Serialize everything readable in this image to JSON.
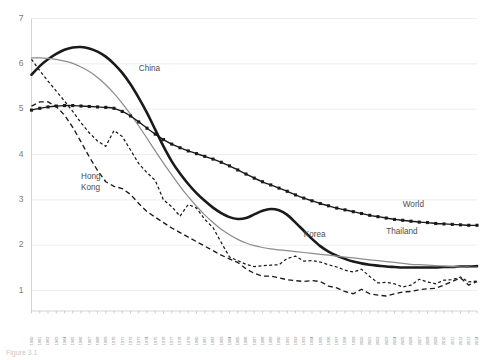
{
  "chart_data": {
    "type": "line",
    "title": "",
    "subtitle": "",
    "xlabel": "",
    "ylabel": "",
    "xlim": [
      1960,
      2014
    ],
    "ylim": [
      0.55,
      7.0
    ],
    "yticks": [
      1,
      2,
      3,
      4,
      5,
      6,
      7
    ],
    "grid": true,
    "legend_position": "inline-annotations",
    "x": [
      1960,
      1961,
      1962,
      1963,
      1964,
      1965,
      1966,
      1967,
      1968,
      1969,
      1970,
      1971,
      1972,
      1973,
      1974,
      1975,
      1976,
      1977,
      1978,
      1979,
      1980,
      1981,
      1982,
      1983,
      1984,
      1985,
      1986,
      1987,
      1988,
      1989,
      1990,
      1991,
      1992,
      1993,
      1994,
      1995,
      1996,
      1997,
      1998,
      1999,
      2000,
      2001,
      2002,
      2003,
      2004,
      2005,
      2006,
      2007,
      2008,
      2009,
      2010,
      2011,
      2012,
      2013,
      2014
    ],
    "categories": [
      "1960",
      "1961",
      "1962",
      "1963",
      "1964",
      "1965",
      "1966",
      "1967",
      "1968",
      "1969",
      "1970",
      "1971",
      "1972",
      "1973",
      "1974",
      "1975",
      "1976",
      "1977",
      "1978",
      "1979",
      "1980",
      "1981",
      "1982",
      "1983",
      "1984",
      "1985",
      "1986",
      "1987",
      "1988",
      "1989",
      "1990",
      "1991",
      "1992",
      "1993",
      "1994",
      "1995",
      "1996",
      "1997",
      "1998",
      "1999",
      "2000",
      "2001",
      "2002",
      "2003",
      "2004",
      "2005",
      "2006",
      "2007",
      "2008",
      "2009",
      "2010",
      "2011",
      "2012",
      "2013",
      "2014"
    ],
    "series": [
      {
        "name": "China",
        "style": "solid-thick",
        "color": "#1a1a1a",
        "label_x": 1973,
        "label_y": 5.85,
        "values": [
          5.76,
          5.95,
          6.1,
          6.22,
          6.31,
          6.36,
          6.37,
          6.34,
          6.27,
          6.16,
          6.0,
          5.8,
          5.55,
          5.25,
          4.92,
          4.55,
          4.18,
          3.85,
          3.58,
          3.35,
          3.15,
          2.98,
          2.83,
          2.71,
          2.62,
          2.58,
          2.6,
          2.68,
          2.76,
          2.8,
          2.77,
          2.67,
          2.5,
          2.32,
          2.14,
          1.98,
          1.86,
          1.77,
          1.7,
          1.64,
          1.6,
          1.57,
          1.55,
          1.53,
          1.52,
          1.51,
          1.51,
          1.51,
          1.51,
          1.51,
          1.52,
          1.52,
          1.53,
          1.53,
          1.54
        ]
      },
      {
        "name": "Thailand",
        "style": "solid-thin",
        "color": "#8c8c8c",
        "label_x": 2003,
        "label_y": 2.25,
        "values": [
          6.13,
          6.13,
          6.12,
          6.1,
          6.06,
          6.01,
          5.93,
          5.83,
          5.7,
          5.54,
          5.35,
          5.13,
          4.89,
          4.63,
          4.36,
          4.08,
          3.81,
          3.55,
          3.3,
          3.07,
          2.86,
          2.67,
          2.5,
          2.35,
          2.23,
          2.13,
          2.05,
          1.99,
          1.95,
          1.92,
          1.9,
          1.88,
          1.86,
          1.84,
          1.82,
          1.8,
          1.78,
          1.76,
          1.74,
          1.72,
          1.7,
          1.68,
          1.66,
          1.64,
          1.62,
          1.6,
          1.58,
          1.57,
          1.56,
          1.55,
          1.54,
          1.53,
          1.52,
          1.52,
          1.51
        ]
      },
      {
        "name": "World",
        "style": "solid-markers",
        "color": "#1a1a1a",
        "label_x": 2005,
        "label_y": 2.85,
        "values": [
          4.98,
          5.02,
          5.05,
          5.07,
          5.08,
          5.08,
          5.07,
          5.06,
          5.05,
          5.04,
          5.02,
          4.95,
          4.85,
          4.72,
          4.58,
          4.45,
          4.33,
          4.23,
          4.15,
          4.08,
          4.02,
          3.96,
          3.9,
          3.83,
          3.75,
          3.66,
          3.57,
          3.48,
          3.4,
          3.33,
          3.26,
          3.19,
          3.11,
          3.04,
          2.98,
          2.92,
          2.87,
          2.82,
          2.78,
          2.74,
          2.7,
          2.66,
          2.63,
          2.6,
          2.57,
          2.55,
          2.53,
          2.51,
          2.5,
          2.48,
          2.47,
          2.46,
          2.45,
          2.44,
          2.44
        ]
      },
      {
        "name": "Hong Kong",
        "style": "dashed-long",
        "color": "#1a1a1a",
        "label_x": 1966,
        "label_y": 3.45,
        "label_lines": [
          "Hong",
          "Kong"
        ],
        "values": [
          5.07,
          5.16,
          5.16,
          5.06,
          4.87,
          4.6,
          4.28,
          3.95,
          3.65,
          3.4,
          3.3,
          3.25,
          3.12,
          2.92,
          2.74,
          2.62,
          2.5,
          2.38,
          2.28,
          2.18,
          2.08,
          1.98,
          1.88,
          1.78,
          1.7,
          1.62,
          1.48,
          1.38,
          1.32,
          1.32,
          1.28,
          1.24,
          1.22,
          1.2,
          1.22,
          1.2,
          1.1,
          1.06,
          0.98,
          0.93,
          1.03,
          0.93,
          0.9,
          0.88,
          0.93,
          0.97,
          0.98,
          1.02,
          1.04,
          1.05,
          1.12,
          1.2,
          1.28,
          1.12,
          1.2
        ]
      },
      {
        "name": "Korea",
        "style": "dashed-short",
        "color": "#1a1a1a",
        "label_x": 1993,
        "label_y": 2.18,
        "values": [
          6.1,
          5.85,
          5.62,
          5.4,
          5.18,
          4.95,
          4.7,
          4.48,
          4.3,
          4.18,
          4.53,
          4.4,
          4.1,
          3.8,
          3.6,
          3.43,
          3.0,
          2.85,
          2.64,
          2.9,
          2.82,
          2.57,
          2.39,
          2.06,
          1.74,
          1.66,
          1.58,
          1.53,
          1.55,
          1.56,
          1.57,
          1.71,
          1.76,
          1.65,
          1.66,
          1.63,
          1.57,
          1.52,
          1.45,
          1.41,
          1.47,
          1.31,
          1.17,
          1.18,
          1.15,
          1.08,
          1.12,
          1.25,
          1.19,
          1.15,
          1.23,
          1.24,
          1.3,
          1.19,
          1.21
        ]
      }
    ]
  },
  "labels": {
    "china": "China",
    "thailand": "Thailand",
    "world": "World",
    "hongkong_line1": "Hong",
    "hongkong_line2": "Kong",
    "korea": "Korea"
  },
  "caption": {
    "text": "Figure 3.1"
  },
  "colors": {
    "china": "#1a1a1a",
    "thailand": "#8c8c8c",
    "world": "#1a1a1a",
    "hongkong": "#1a1a1a",
    "korea": "#1a1a1a",
    "grid": "#e8e8e8",
    "axis": "#d0d0d0",
    "tick_text": "#7a7a7a"
  }
}
